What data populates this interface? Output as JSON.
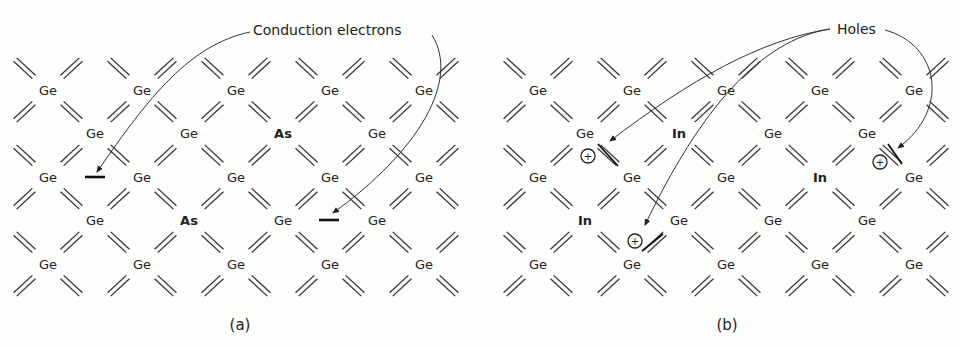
{
  "figure": {
    "panel_a": {
      "caption": "(a)",
      "annotation": "Conduction electrons",
      "origin_x": 48,
      "atoms": [
        {
          "row": 0,
          "col": 0,
          "label": "Ge"
        },
        {
          "row": 0,
          "col": 2,
          "label": "Ge"
        },
        {
          "row": 0,
          "col": 4,
          "label": "Ge"
        },
        {
          "row": 0,
          "col": 6,
          "label": "Ge"
        },
        {
          "row": 0,
          "col": 8,
          "label": "Ge"
        },
        {
          "row": 1,
          "col": 1,
          "label": "Ge"
        },
        {
          "row": 1,
          "col": 3,
          "label": "Ge"
        },
        {
          "row": 1,
          "col": 5,
          "label": "As",
          "bold": true
        },
        {
          "row": 1,
          "col": 7,
          "label": "Ge"
        },
        {
          "row": 2,
          "col": 0,
          "label": "Ge"
        },
        {
          "row": 2,
          "col": 2,
          "label": "Ge"
        },
        {
          "row": 2,
          "col": 4,
          "label": "Ge"
        },
        {
          "row": 2,
          "col": 6,
          "label": "Ge"
        },
        {
          "row": 2,
          "col": 8,
          "label": "Ge"
        },
        {
          "row": 3,
          "col": 1,
          "label": "Ge"
        },
        {
          "row": 3,
          "col": 3,
          "label": "As",
          "bold": true
        },
        {
          "row": 3,
          "col": 5,
          "label": "Ge"
        },
        {
          "row": 3,
          "col": 7,
          "label": "Ge"
        },
        {
          "row": 4,
          "col": 0,
          "label": "Ge"
        },
        {
          "row": 4,
          "col": 2,
          "label": "Ge"
        },
        {
          "row": 4,
          "col": 4,
          "label": "Ge"
        },
        {
          "row": 4,
          "col": 6,
          "label": "Ge"
        },
        {
          "row": 4,
          "col": 8,
          "label": "Ge"
        }
      ],
      "electrons": [
        {
          "x": 95,
          "y": 177
        },
        {
          "x": 329,
          "y": 220
        }
      ]
    },
    "panel_b": {
      "caption": "(b)",
      "annotation": "Holes",
      "origin_x": 538,
      "atoms": [
        {
          "row": 0,
          "col": 0,
          "label": "Ge"
        },
        {
          "row": 0,
          "col": 2,
          "label": "Ge"
        },
        {
          "row": 0,
          "col": 4,
          "label": "Ge"
        },
        {
          "row": 0,
          "col": 6,
          "label": "Ge"
        },
        {
          "row": 0,
          "col": 8,
          "label": "Ge"
        },
        {
          "row": 1,
          "col": 1,
          "label": "Ge"
        },
        {
          "row": 1,
          "col": 3,
          "label": "In",
          "bold": true
        },
        {
          "row": 1,
          "col": 5,
          "label": "Ge"
        },
        {
          "row": 1,
          "col": 7,
          "label": "Ge"
        },
        {
          "row": 2,
          "col": 0,
          "label": "Ge"
        },
        {
          "row": 2,
          "col": 2,
          "label": "Ge"
        },
        {
          "row": 2,
          "col": 4,
          "label": "Ge"
        },
        {
          "row": 2,
          "col": 6,
          "label": "In",
          "bold": true
        },
        {
          "row": 2,
          "col": 8,
          "label": "Ge"
        },
        {
          "row": 3,
          "col": 1,
          "label": "In",
          "bold": true
        },
        {
          "row": 3,
          "col": 3,
          "label": "Ge"
        },
        {
          "row": 3,
          "col": 5,
          "label": "Ge"
        },
        {
          "row": 3,
          "col": 7,
          "label": "Ge"
        },
        {
          "row": 4,
          "col": 0,
          "label": "Ge"
        },
        {
          "row": 4,
          "col": 2,
          "label": "Ge"
        },
        {
          "row": 4,
          "col": 4,
          "label": "Ge"
        },
        {
          "row": 4,
          "col": 6,
          "label": "Ge"
        },
        {
          "row": 4,
          "col": 8,
          "label": "Ge"
        }
      ],
      "holes": [
        {
          "cx": 588,
          "cy": 156,
          "bar": [
            598,
            144,
            618,
            166
          ]
        },
        {
          "cx": 880,
          "cy": 162,
          "bar": [
            888,
            144,
            902,
            164
          ]
        },
        {
          "cx": 635,
          "cy": 241,
          "bar": [
            642,
            251,
            663,
            234
          ]
        }
      ],
      "hole_symbol": "+"
    }
  }
}
